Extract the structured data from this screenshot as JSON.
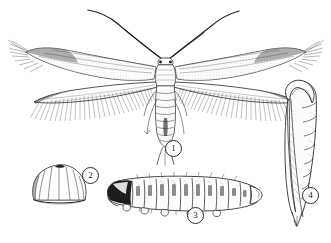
{
  "plate": {
    "title": "Moth life stages plate",
    "medium": "black and white stipple and line engraving",
    "background_color": "#ffffff",
    "ink_color": "#1a1a1a",
    "width": 331,
    "height": 243
  },
  "figures": [
    {
      "key": "adult",
      "label": "1",
      "name": "adult-moth",
      "description": "Adult moth, dorsal view, wings spread, long curving antennae, narrow lanceolate wings with long hair fringe, segmented abdomen",
      "label_x": 165,
      "label_y": 140
    },
    {
      "key": "egg",
      "label": "2",
      "name": "egg",
      "description": "Dome shaped egg with vertical ribbing and flattened base",
      "label_x": 82,
      "label_y": 167
    },
    {
      "key": "larva",
      "label": "3",
      "name": "larva",
      "description": "Caterpillar larva in lateral view, dark head capsule at left, twelve segmented body with setae, tapering posterior",
      "label_x": 187,
      "label_y": 207
    },
    {
      "key": "pupa",
      "label": "4",
      "name": "pupa",
      "description": "Elongate pupa, rounded cephalic end at top, wing cases along left side, segmented abdomen tapering to pointed cremaster",
      "label_x": 302,
      "label_y": 187
    }
  ]
}
